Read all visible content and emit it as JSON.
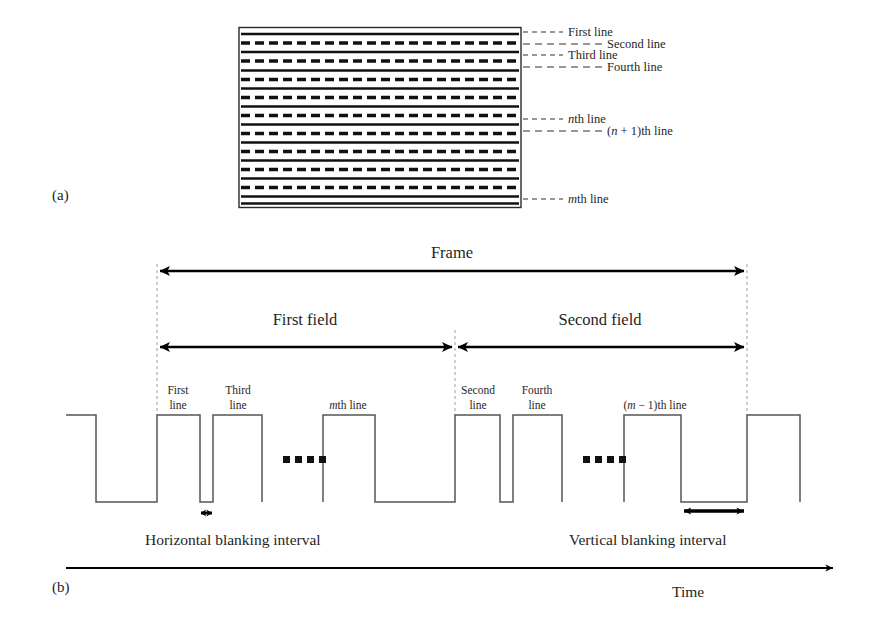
{
  "figure": {
    "panel_a_label": "(a)",
    "panel_b_label": "(b)"
  },
  "raster": {
    "labels": {
      "first": "First line",
      "second": "Second line",
      "third": "Third line",
      "fourth": "Fourth line",
      "nth": "th line",
      "nth_italic": "n",
      "n_plus_1_prefix": "(",
      "n_plus_1_italic": "n",
      "n_plus_1_suffix": " + 1)th line",
      "mth": "th line",
      "mth_italic": "m"
    },
    "line_count": 20,
    "odd_line_style": "solid",
    "even_line_style": "dashed"
  },
  "timing": {
    "frame_label": "Frame",
    "first_field_label": "First field",
    "second_field_label": "Second field",
    "pulse_labels": {
      "first_line_1": "First",
      "first_line_2": "line",
      "third_line_1": "Third",
      "third_line_2": "line",
      "mth_italic": "m",
      "mth_rest": "th line",
      "second_line_1": "Second",
      "second_line_2": "line",
      "fourth_line_1": "Fourth",
      "fourth_line_2": "line",
      "m_minus_1_prefix": "(",
      "m_minus_1_italic": "m",
      "m_minus_1_suffix": " − 1)th line"
    },
    "ellipsis_dots": 4,
    "horizontal_blanking_label": "Horizontal blanking interval",
    "vertical_blanking_label": "Vertical blanking interval",
    "time_axis_label": "Time"
  },
  "colors": {
    "ink": "#1f1f1f",
    "waveform": "#555555",
    "guide": "#9a9a9a",
    "arrow": "#000000",
    "background": "#ffffff"
  }
}
